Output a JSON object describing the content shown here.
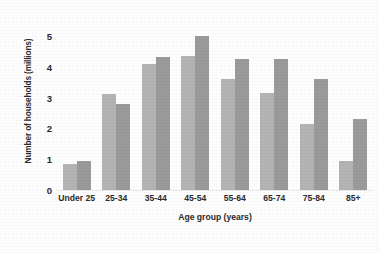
{
  "chart_data": {
    "type": "bar",
    "title": "",
    "xlabel": "Age group (years)",
    "ylabel": "Number of households (millions)",
    "categories": [
      "Under 25",
      "25-34",
      "35-44",
      "45-54",
      "55-64",
      "65-74",
      "75-84",
      "85+"
    ],
    "series": [
      {
        "name": "series-1",
        "color": "#b4b4b4",
        "values": [
          0.85,
          3.1,
          4.1,
          4.35,
          3.6,
          3.15,
          2.15,
          0.95
        ]
      },
      {
        "name": "series-2",
        "color": "#9b9b9b",
        "values": [
          0.95,
          2.8,
          4.3,
          5.0,
          4.25,
          4.25,
          3.6,
          2.3
        ]
      }
    ],
    "yticks": [
      0,
      1,
      2,
      3,
      4,
      5
    ],
    "ytick_labels": [
      "0",
      "1",
      "2",
      "3",
      "4",
      "5"
    ],
    "ylim": [
      0,
      5.45
    ],
    "grid": false,
    "legend": "none",
    "axis_color": "#e9e9e9"
  }
}
